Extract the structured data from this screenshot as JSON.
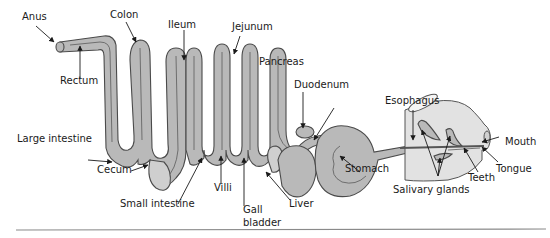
{
  "figure": {
    "type": "labeled anatomical diagram",
    "colors": {
      "organ_fill": "#b9b9b9",
      "organ_stroke": "#4a4a4a",
      "head_fill": "#e2e2e2",
      "label_text": "#1a1a1a",
      "rule": "#8a8a8a"
    }
  },
  "labels": {
    "anus": "Anus",
    "colon": "Colon",
    "ileum": "Ileum",
    "jejunum": "Jejunum",
    "pancreas": "Pancreas",
    "duodenum": "Duodenum",
    "esophagus": "Esophagus",
    "rectum": "Rectum",
    "large_intestine": "Large intestine",
    "cecum": "Cecum",
    "small_intestine": "Small intestine",
    "villi": "Villi",
    "gall": "Gall",
    "bladder": "bladder",
    "liver": "Liver",
    "stomach": "Stomach",
    "mouth": "Mouth",
    "tongue": "Tongue",
    "teeth": "Teeth",
    "salivary_glands": "Salivary glands"
  }
}
